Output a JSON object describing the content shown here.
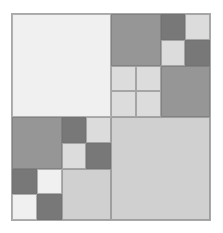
{
  "figure": {
    "width": 223,
    "height": 233,
    "background": "#ffffff",
    "frame": {
      "x": 11,
      "y": 13,
      "width": 200,
      "height": 208,
      "border_color": "#a8a8a8",
      "border_width": 1
    },
    "palette": {
      "lightest": "#f0f0f0",
      "light": "#dcdcdc",
      "light_mid": "#d0d0d0",
      "mid": "#969696",
      "dark": "#787878",
      "line": "#6e6e6e"
    }
  },
  "tree": {
    "label": "root",
    "children": [
      {
        "label": "top-left",
        "color": "#f0f0f0"
      },
      {
        "label": "top-right",
        "children": [
          {
            "label": "tr-top-left",
            "color": "#969696"
          },
          {
            "label": "tr-top-right",
            "children": [
              {
                "label": "tr-tr-top-left",
                "color": "#787878"
              },
              {
                "label": "tr-tr-top-right",
                "color": "#dcdcdc"
              },
              {
                "label": "tr-tr-bottom-left",
                "color": "#dcdcdc"
              },
              {
                "label": "tr-tr-bottom-right",
                "color": "#787878"
              }
            ]
          },
          {
            "label": "tr-bottom-left",
            "children": [
              {
                "label": "tr-bl-top-left",
                "color": "#dcdcdc"
              },
              {
                "label": "tr-bl-top-right",
                "color": "#dcdcdc"
              },
              {
                "label": "tr-bl-bottom-left",
                "color": "#dcdcdc"
              },
              {
                "label": "tr-bl-bottom-right",
                "color": "#dcdcdc"
              }
            ]
          },
          {
            "label": "tr-bottom-right",
            "color": "#969696"
          }
        ]
      },
      {
        "label": "bottom-left",
        "children": [
          {
            "label": "bl-top-left",
            "color": "#969696"
          },
          {
            "label": "bl-top-right",
            "children": [
              {
                "label": "bl-tr-top-left",
                "color": "#787878"
              },
              {
                "label": "bl-tr-top-right",
                "color": "#dcdcdc"
              },
              {
                "label": "bl-tr-bottom-left",
                "color": "#dcdcdc"
              },
              {
                "label": "bl-tr-bottom-right",
                "color": "#787878"
              }
            ]
          },
          {
            "label": "bl-bottom-left",
            "children": [
              {
                "label": "bl-bl-top-left",
                "color": "#787878"
              },
              {
                "label": "bl-bl-top-right",
                "color": "#f0f0f0"
              },
              {
                "label": "bl-bl-bottom-left",
                "color": "#f0f0f0"
              },
              {
                "label": "bl-bl-bottom-right",
                "color": "#787878"
              }
            ]
          },
          {
            "label": "bl-bottom-right",
            "color": "#d0d0d0"
          }
        ]
      },
      {
        "label": "bottom-right",
        "color": "#d0d0d0"
      }
    ]
  }
}
